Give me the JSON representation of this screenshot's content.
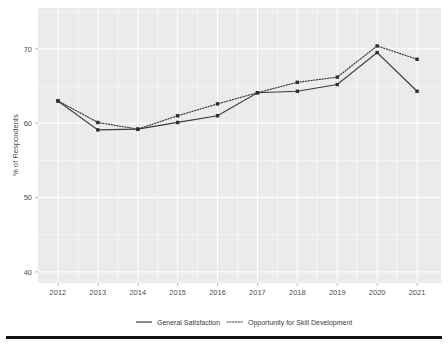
{
  "chart_data": {
    "type": "line",
    "title": "",
    "subtitle": "",
    "xlabel": "",
    "ylabel": "% of Respondents",
    "x": [
      2012,
      2013,
      2014,
      2015,
      2016,
      2017,
      2018,
      2019,
      2020,
      2021
    ],
    "categories": [
      "2012",
      "2013",
      "2014",
      "2015",
      "2016",
      "2017",
      "2018",
      "2019",
      "2020",
      "2021"
    ],
    "xticklabels": [
      "2012",
      "2013",
      "2014",
      "2015",
      "2016",
      "2017",
      "2018",
      "2019",
      "2020",
      "2021"
    ],
    "yticklabels": [
      "40",
      "50",
      "60",
      "70"
    ],
    "yticks": [
      40,
      50,
      60,
      70
    ],
    "ylim": [
      38.5,
      75.5
    ],
    "xlim": [
      2011.5,
      2021.6
    ],
    "grid": true,
    "legend_position": "bottom",
    "series": [
      {
        "name": "General Satisfaction",
        "style": "solid",
        "color": "#3c3c3c",
        "values": [
          63.0,
          59.1,
          59.2,
          60.1,
          61.0,
          64.1,
          64.3,
          65.2,
          69.5,
          64.3
        ]
      },
      {
        "name": "Opportunity for Skill Development",
        "style": "dotted",
        "color": "#3c3c3c",
        "values": [
          63.0,
          60.1,
          59.2,
          61.0,
          62.6,
          64.1,
          65.5,
          66.2,
          70.4,
          68.6
        ]
      }
    ]
  },
  "legend": {
    "entries": [
      {
        "label": "General Satisfaction",
        "style": "solid"
      },
      {
        "label": "Opportunity for Skill Development",
        "style": "dotted"
      }
    ]
  },
  "axes": {
    "y_axis_title": "% of Respondents"
  },
  "colors": {
    "panel_background": "#ebebeb",
    "gridline": "#ffffff",
    "line": "#3c3c3c",
    "text": "#4d4d4d",
    "page_background": "#ffffff",
    "footer_bar": "#121212"
  }
}
